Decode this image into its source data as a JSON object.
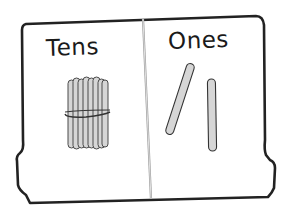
{
  "mat": {
    "title": "Place value mat",
    "columns": [
      {
        "label": "Tens",
        "items": {
          "type": "bundle-of-sticks",
          "count": 1,
          "sticks_per_bundle": 10
        }
      },
      {
        "label": "Ones",
        "items": {
          "type": "single-stick",
          "count": 2
        }
      }
    ],
    "represented_value": 12
  },
  "colors": {
    "outline": "#222222",
    "stick_fill": "#d6d6d6",
    "stick_stroke": "#4a4a4a",
    "divider": "#9a9a9a",
    "background": "#ffffff"
  }
}
